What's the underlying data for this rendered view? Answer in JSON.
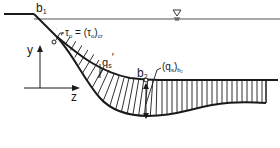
{
  "diagram": {
    "type": "channel-cross-section",
    "labels": {
      "b1": "b",
      "b1_sub": "1",
      "b2": "b",
      "b2_sub": "2",
      "y_axis": "y",
      "z_axis": "z",
      "tau": "τ",
      "tau_sub": "o",
      "tau_eq": " = (τ",
      "tau_sub2": "o",
      "tau_close": ")",
      "tau_cr": "cr",
      "qs_prime": "q",
      "qs_prime_sub": "s",
      "qs_prime_mark": "′",
      "qs_b2_open": "(q",
      "qs_b2_sub": "s",
      "qs_b2_close": ")",
      "qs_b2_sub2": "b",
      "qs_b2_sub3": "2"
    },
    "water_surface_symbol": "▽",
    "colors": {
      "line": "#1a1a1a",
      "water_line": "#555555",
      "background": "#ffffff"
    }
  }
}
